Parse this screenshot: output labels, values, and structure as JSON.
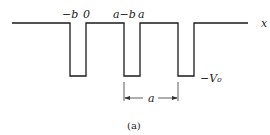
{
  "diagram": {
    "axis_label": "x",
    "well_depth_label": "−V₀",
    "top_labels": {
      "neg_b": "−b",
      "zero": "0",
      "a_minus_b": "a−b",
      "a": "a"
    },
    "period_label": "a",
    "caption": "(a)",
    "colors": {
      "line": "#1a1a1a",
      "background": "#ffffff"
    }
  }
}
